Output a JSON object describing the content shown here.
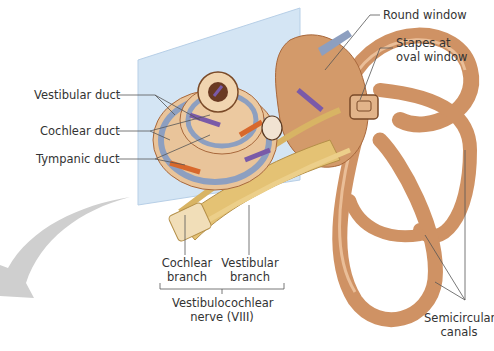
{
  "figure": {
    "colors": {
      "bone": "#d39a6a",
      "bone_dark": "#a8683c",
      "cochlea_light": "#ecc9a0",
      "duct_blue": "#8d9fc0",
      "nerve": "#e4c274",
      "arrow_purple": "#7a5aa8",
      "arrow_orange": "#d8682c",
      "plane": "#bcd6ee",
      "pointer_arrow": "#c8c8c8",
      "label_text": "#333333",
      "leader_line": "#555555"
    }
  },
  "labels": {
    "vestibular_duct": "Vestibular duct",
    "cochlear_duct": "Cochlear duct",
    "tympanic_duct": "Tympanic duct",
    "round_window": "Round window",
    "stapes_line1": "Stapes at",
    "stapes_line2": "oval window",
    "cochlear_branch_line1": "Cochlear",
    "cochlear_branch_line2": "branch",
    "vestibular_branch_line1": "Vestibular",
    "vestibular_branch_line2": "branch",
    "nerve_line1": "Vestibulocochlear",
    "nerve_line2": "nerve (VIII)",
    "semicircular_line1": "Semicircular",
    "semicircular_line2": "canals"
  }
}
